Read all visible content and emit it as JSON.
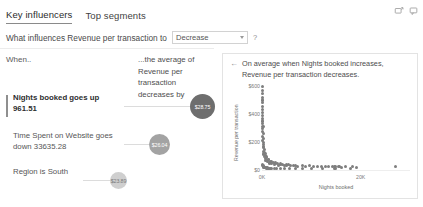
{
  "header": {
    "tabs": [
      {
        "label": "Key influencers",
        "active": true
      },
      {
        "label": "Top segments",
        "active": false
      }
    ],
    "icons": [
      {
        "name": "focus-mode-icon"
      },
      {
        "name": "comment-icon"
      }
    ]
  },
  "question": {
    "prefix": "What influences Revenue per transaction to",
    "dropdown_value": "Decrease",
    "dropdown_options": [
      "Increase",
      "Decrease"
    ],
    "help_label": "?"
  },
  "left_panel": {
    "when_label": "When..",
    "average_label": "...the average of Revenue per transaction decreases by",
    "influencers": [
      {
        "label": "Nights booked goes up 961.51",
        "value": "$28.75",
        "primary": true,
        "bubble_diameter": 25,
        "bubble_color": "#6e6e6e"
      },
      {
        "label": "Time Spent on Website goes down 33635.28",
        "value": "$26.04",
        "primary": false,
        "bubble_diameter": 21,
        "bubble_color": "#a3a3a3"
      },
      {
        "label": "Region is South",
        "value": "$23.89",
        "primary": false,
        "bubble_diameter": 17,
        "bubble_color": "#cfcfcf"
      }
    ]
  },
  "right_panel": {
    "back_arrow": "←",
    "title": "On average when Nights booked increases, Revenue per transaction decreases.",
    "chart_data": {
      "type": "scatter",
      "title": "",
      "xlabel": "Nights booked",
      "ylabel": "Revenue per transaction",
      "xlim": [
        0,
        30000
      ],
      "ylim": [
        0,
        600
      ],
      "xticks": [
        0,
        20000
      ],
      "xticklabels": [
        "0K",
        "20K"
      ],
      "yticks": [
        0,
        200,
        400,
        600
      ],
      "yticklabels": [
        "$0",
        "$200",
        "$400",
        "$600"
      ],
      "grid": false,
      "legend": "none",
      "points": [
        {
          "x": 120,
          "y": 595
        },
        {
          "x": 160,
          "y": 570
        },
        {
          "x": 140,
          "y": 545
        },
        {
          "x": 150,
          "y": 520
        },
        {
          "x": 135,
          "y": 500
        },
        {
          "x": 170,
          "y": 480
        },
        {
          "x": 150,
          "y": 455
        },
        {
          "x": 130,
          "y": 430
        },
        {
          "x": 160,
          "y": 410
        },
        {
          "x": 145,
          "y": 390
        },
        {
          "x": 180,
          "y": 370
        },
        {
          "x": 155,
          "y": 350
        },
        {
          "x": 140,
          "y": 330
        },
        {
          "x": 200,
          "y": 312
        },
        {
          "x": 165,
          "y": 295
        },
        {
          "x": 150,
          "y": 275
        },
        {
          "x": 230,
          "y": 258
        },
        {
          "x": 190,
          "y": 240
        },
        {
          "x": 260,
          "y": 225
        },
        {
          "x": 175,
          "y": 210
        },
        {
          "x": 300,
          "y": 196
        },
        {
          "x": 210,
          "y": 182
        },
        {
          "x": 340,
          "y": 170
        },
        {
          "x": 250,
          "y": 158
        },
        {
          "x": 420,
          "y": 146
        },
        {
          "x": 290,
          "y": 135
        },
        {
          "x": 520,
          "y": 124
        },
        {
          "x": 360,
          "y": 114
        },
        {
          "x": 700,
          "y": 104
        },
        {
          "x": 480,
          "y": 96
        },
        {
          "x": 900,
          "y": 88
        },
        {
          "x": 620,
          "y": 80
        },
        {
          "x": 1250,
          "y": 74
        },
        {
          "x": 820,
          "y": 68
        },
        {
          "x": 1700,
          "y": 63
        },
        {
          "x": 1050,
          "y": 58
        },
        {
          "x": 2300,
          "y": 54
        },
        {
          "x": 1450,
          "y": 50
        },
        {
          "x": 3100,
          "y": 47
        },
        {
          "x": 1900,
          "y": 44
        },
        {
          "x": 4200,
          "y": 42
        },
        {
          "x": 2600,
          "y": 39
        },
        {
          "x": 5400,
          "y": 37
        },
        {
          "x": 3400,
          "y": 35
        },
        {
          "x": 6800,
          "y": 34
        },
        {
          "x": 4600,
          "y": 32
        },
        {
          "x": 8200,
          "y": 31
        },
        {
          "x": 5800,
          "y": 30
        },
        {
          "x": 9600,
          "y": 29
        },
        {
          "x": 7200,
          "y": 28
        },
        {
          "x": 11200,
          "y": 27
        },
        {
          "x": 8800,
          "y": 26
        },
        {
          "x": 12800,
          "y": 26
        },
        {
          "x": 10400,
          "y": 25
        },
        {
          "x": 14200,
          "y": 25
        },
        {
          "x": 12000,
          "y": 24
        },
        {
          "x": 15600,
          "y": 24
        },
        {
          "x": 13400,
          "y": 23
        },
        {
          "x": 17000,
          "y": 23
        },
        {
          "x": 14800,
          "y": 22
        },
        {
          "x": 18400,
          "y": 22
        },
        {
          "x": 16200,
          "y": 21
        },
        {
          "x": 19200,
          "y": 21
        },
        {
          "x": 700,
          "y": 120
        },
        {
          "x": 950,
          "y": 95
        },
        {
          "x": 1400,
          "y": 78
        },
        {
          "x": 2000,
          "y": 62
        },
        {
          "x": 2800,
          "y": 50
        },
        {
          "x": 3800,
          "y": 43
        },
        {
          "x": 5000,
          "y": 36
        },
        {
          "x": 6400,
          "y": 33
        },
        {
          "x": 160,
          "y": 42
        },
        {
          "x": 200,
          "y": 35
        },
        {
          "x": 240,
          "y": 28
        },
        {
          "x": 300,
          "y": 24
        },
        {
          "x": 380,
          "y": 20
        },
        {
          "x": 470,
          "y": 18
        },
        {
          "x": 580,
          "y": 16
        },
        {
          "x": 720,
          "y": 15
        },
        {
          "x": 880,
          "y": 14
        },
        {
          "x": 1080,
          "y": 14
        },
        {
          "x": 1320,
          "y": 13
        },
        {
          "x": 1620,
          "y": 13
        },
        {
          "x": 2000,
          "y": 12
        },
        {
          "x": 2450,
          "y": 12
        },
        {
          "x": 3000,
          "y": 11
        },
        {
          "x": 3700,
          "y": 11
        },
        {
          "x": 4500,
          "y": 10
        },
        {
          "x": 5500,
          "y": 10
        },
        {
          "x": 6700,
          "y": 10
        },
        {
          "x": 8200,
          "y": 9
        },
        {
          "x": 10000,
          "y": 9
        },
        {
          "x": 12200,
          "y": 9
        },
        {
          "x": 14800,
          "y": 8
        },
        {
          "x": 18000,
          "y": 8
        },
        {
          "x": 27000,
          "y": 26
        }
      ]
    }
  }
}
